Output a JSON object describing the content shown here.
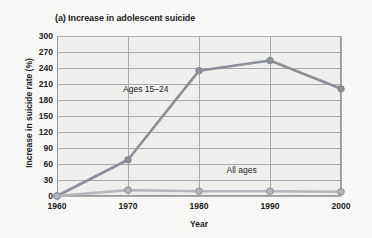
{
  "figure": {
    "title": "(a) Increase in adolescent suicide",
    "xlabel": "Year",
    "ylabel": "Increase in suicide rate (%)",
    "plot_bg_color": "#efefee",
    "page_bg_color": "#f7f7f6",
    "grid_color": "#a9a9a9",
    "frame_color": "#9a9a9a"
  },
  "chart_data": {
    "type": "line",
    "title": "(a) Increase in adolescent suicide",
    "xlabel": "Year",
    "ylabel": "Increase in suicide rate (%)",
    "x": [
      1960,
      1970,
      1980,
      1990,
      2000
    ],
    "xtick_labels": [
      "1960",
      "1970",
      "1980",
      "1990",
      "2000"
    ],
    "ytick_labels": [
      "0",
      "30",
      "60",
      "90",
      "120",
      "150",
      "180",
      "210",
      "240",
      "270",
      "300"
    ],
    "yticks": [
      0,
      30,
      60,
      90,
      120,
      150,
      180,
      210,
      240,
      270,
      300
    ],
    "xlim": [
      1960,
      2000
    ],
    "ylim": [
      0,
      300
    ],
    "grid": true,
    "legend": "inline-annotations",
    "series": [
      {
        "name": "Ages 15–24",
        "values": [
          0,
          68,
          235,
          254,
          201
        ],
        "color": "#8a8f99",
        "marker": "circle",
        "annotation": "Ages 15–24",
        "annotation_x": 1972.5,
        "annotation_y": 200
      },
      {
        "name": "All ages",
        "values": [
          0,
          11,
          9,
          9,
          8
        ],
        "color": "#b3b7bd",
        "marker": "circle",
        "annotation": "All ages",
        "annotation_x": 1986,
        "annotation_y": 48
      }
    ]
  }
}
